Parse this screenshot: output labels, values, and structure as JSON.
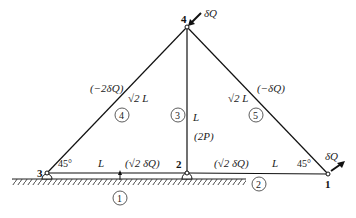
{
  "diagram": {
    "type": "truss",
    "nodes": [
      {
        "id": "1",
        "label": "1",
        "x": 328,
        "y": 174
      },
      {
        "id": "2",
        "label": "2",
        "x": 187,
        "y": 173
      },
      {
        "id": "3",
        "label": "3",
        "x": 47,
        "y": 173
      },
      {
        "id": "4",
        "label": "4",
        "x": 187,
        "y": 27
      }
    ],
    "members": [
      {
        "id": "1",
        "label": "1",
        "from": "3",
        "to": "2",
        "length": "L",
        "force": "(√2 δQ)"
      },
      {
        "id": "2",
        "label": "2",
        "from": "2",
        "to": "1",
        "length": "L",
        "force": "(√2 δQ)"
      },
      {
        "id": "3",
        "label": "3",
        "from": "2",
        "to": "4",
        "length": "L",
        "force": "(2P)"
      },
      {
        "id": "4",
        "label": "4",
        "from": "3",
        "to": "4",
        "length": "√2 L",
        "force": "(−2δQ)"
      },
      {
        "id": "5",
        "label": "5",
        "from": "4",
        "to": "1",
        "length": "√2 L",
        "force": "(−δQ)"
      }
    ],
    "loads": [
      {
        "node": "4",
        "label": "δQ"
      },
      {
        "node": "1",
        "label": "δQ"
      }
    ],
    "angles": [
      {
        "node": "3",
        "label": "45°"
      },
      {
        "node": "1",
        "label": "45°"
      }
    ]
  }
}
